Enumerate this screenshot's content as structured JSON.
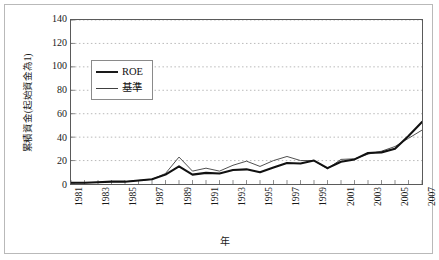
{
  "chart_data": {
    "type": "line",
    "title": "",
    "xlabel": "年",
    "ylabel": "累積資金(起始資金為1)",
    "ylim": [
      0,
      140
    ],
    "yticks": [
      0,
      20,
      40,
      60,
      80,
      100,
      120,
      140
    ],
    "grid": true,
    "legend_position": "upper-left",
    "x": [
      1981,
      1982,
      1983,
      1984,
      1985,
      1986,
      1987,
      1988,
      1989,
      1990,
      1991,
      1992,
      1993,
      1994,
      1995,
      1996,
      1997,
      1998,
      1999,
      2000,
      2001,
      2002,
      2003,
      2004,
      2005,
      2006,
      2007
    ],
    "xtick_labels": [
      "1981",
      "1983",
      "1985",
      "1987",
      "1989",
      "1991",
      "1993",
      "1995",
      "1997",
      "1999",
      "2001",
      "2003",
      "2005",
      "2007"
    ],
    "series": [
      {
        "name": "ROE",
        "style": "thick",
        "color": "#111111",
        "values": [
          1,
          1,
          1.5,
          2,
          2,
          3,
          4,
          8,
          15,
          8,
          9.5,
          9,
          12,
          12.5,
          10,
          14,
          18,
          17.5,
          20,
          13.5,
          19,
          21,
          26.5,
          27,
          30,
          41,
          53
        ]
      },
      {
        "name": "基準",
        "style": "thin",
        "color": "#3a3a3a",
        "values": [
          1,
          1,
          1.5,
          2,
          2,
          3,
          4,
          9,
          23,
          11,
          13.5,
          11,
          16,
          19.5,
          15,
          20,
          23.5,
          20,
          20,
          13,
          21,
          21.5,
          25.5,
          28,
          32,
          39,
          46
        ]
      }
    ]
  },
  "legend": {
    "items": [
      {
        "label": "ROE"
      },
      {
        "label": "基準"
      }
    ]
  },
  "axis": {
    "y_title": "累積資金(起始資金為1)",
    "x_title": "年"
  }
}
